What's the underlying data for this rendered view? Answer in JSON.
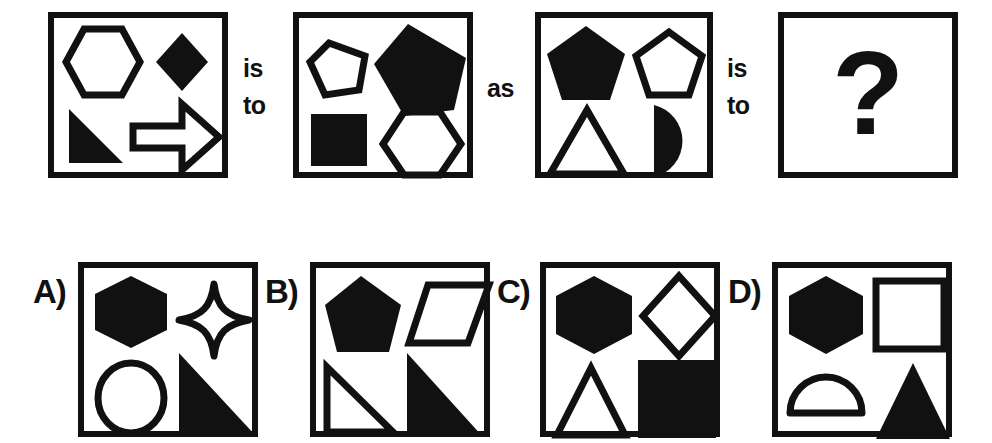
{
  "puzzle": {
    "kind": "visual-analogy-multiple-choice",
    "question_mark": "?",
    "connectors": [
      {
        "name": "is-to-1",
        "line1": "is",
        "line2": "to"
      },
      {
        "name": "as",
        "line1": "as",
        "line2": ""
      },
      {
        "name": "is-to-2",
        "line1": "is",
        "line2": "to"
      }
    ],
    "colors": {
      "ink": "#111111",
      "paper": "#ffffff"
    },
    "prompt_panels": [
      {
        "name": "prompt-panel-1",
        "shapes": [
          {
            "slot": "top-left",
            "shape": "hexagon",
            "fill": "outline"
          },
          {
            "slot": "top-right",
            "shape": "diamond",
            "fill": "solid"
          },
          {
            "slot": "bottom-left",
            "shape": "right-triangle",
            "fill": "solid"
          },
          {
            "slot": "bottom-right",
            "shape": "arrow-right",
            "fill": "outline"
          }
        ]
      },
      {
        "name": "prompt-panel-2",
        "shapes": [
          {
            "slot": "top-left",
            "shape": "pentagon",
            "fill": "outline"
          },
          {
            "slot": "top-right",
            "shape": "pentagon",
            "fill": "solid"
          },
          {
            "slot": "bottom-left",
            "shape": "square",
            "fill": "solid"
          },
          {
            "slot": "bottom-right",
            "shape": "hexagon",
            "fill": "outline"
          }
        ]
      },
      {
        "name": "prompt-panel-3",
        "shapes": [
          {
            "slot": "top-left",
            "shape": "pentagon",
            "fill": "solid"
          },
          {
            "slot": "top-right",
            "shape": "pentagon",
            "fill": "outline"
          },
          {
            "slot": "bottom-left",
            "shape": "triangle",
            "fill": "outline"
          },
          {
            "slot": "bottom-right",
            "shape": "semicircle",
            "fill": "solid"
          }
        ]
      },
      {
        "name": "prompt-panel-4-unknown",
        "shapes": []
      }
    ],
    "options": [
      {
        "name": "option-a",
        "label": "A)",
        "shapes": [
          {
            "slot": "top-left",
            "shape": "hexagon",
            "fill": "solid"
          },
          {
            "slot": "top-right",
            "shape": "four-point-star",
            "fill": "outline"
          },
          {
            "slot": "bottom-left",
            "shape": "circle",
            "fill": "outline"
          },
          {
            "slot": "bottom-right",
            "shape": "right-triangle",
            "fill": "solid"
          }
        ]
      },
      {
        "name": "option-b",
        "label": "B)",
        "shapes": [
          {
            "slot": "top-left",
            "shape": "pentagon",
            "fill": "solid"
          },
          {
            "slot": "top-right",
            "shape": "parallelogram",
            "fill": "outline"
          },
          {
            "slot": "bottom-left",
            "shape": "right-triangle",
            "fill": "outline"
          },
          {
            "slot": "bottom-right",
            "shape": "right-triangle",
            "fill": "solid"
          }
        ]
      },
      {
        "name": "option-c",
        "label": "C)",
        "shapes": [
          {
            "slot": "top-left",
            "shape": "hexagon",
            "fill": "solid"
          },
          {
            "slot": "top-right",
            "shape": "diamond",
            "fill": "outline"
          },
          {
            "slot": "bottom-left",
            "shape": "triangle",
            "fill": "outline"
          },
          {
            "slot": "bottom-right",
            "shape": "square",
            "fill": "solid"
          }
        ]
      },
      {
        "name": "option-d",
        "label": "D)",
        "shapes": [
          {
            "slot": "top-left",
            "shape": "hexagon",
            "fill": "solid"
          },
          {
            "slot": "top-right",
            "shape": "square",
            "fill": "outline"
          },
          {
            "slot": "bottom-left",
            "shape": "semicircle",
            "fill": "outline"
          },
          {
            "slot": "bottom-right",
            "shape": "triangle",
            "fill": "solid"
          }
        ]
      }
    ]
  }
}
